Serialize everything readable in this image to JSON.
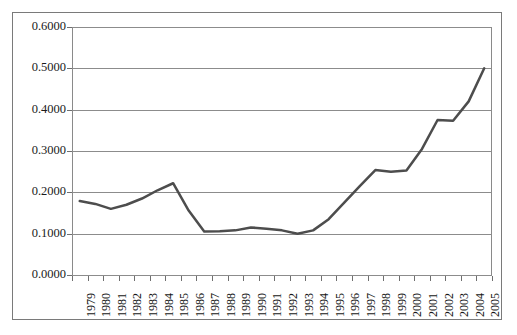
{
  "chart_data": {
    "type": "line",
    "title": "",
    "subtitle": "",
    "xlabel": "",
    "ylabel": "",
    "categories": [
      "1979",
      "1980",
      "1981",
      "1982",
      "1983",
      "1984",
      "1985",
      "1986",
      "1987",
      "1988",
      "1989",
      "1990",
      "1991",
      "1992",
      "1993",
      "1994",
      "1995",
      "1996",
      "1997",
      "1998",
      "1999",
      "2000",
      "2001",
      "2002",
      "2003",
      "2004",
      "2005"
    ],
    "values": [
      0.179,
      0.172,
      0.16,
      0.17,
      0.185,
      0.205,
      0.222,
      0.156,
      0.105,
      0.106,
      0.108,
      0.115,
      0.112,
      0.108,
      0.1,
      0.108,
      0.135,
      0.175,
      0.215,
      0.254,
      0.25,
      0.253,
      0.305,
      0.375,
      0.373,
      0.42,
      0.5
    ],
    "series": [
      {
        "name": "series-1",
        "values": [
          0.179,
          0.172,
          0.16,
          0.17,
          0.185,
          0.205,
          0.222,
          0.156,
          0.105,
          0.106,
          0.108,
          0.115,
          0.112,
          0.108,
          0.1,
          0.108,
          0.135,
          0.175,
          0.215,
          0.254,
          0.25,
          0.253,
          0.305,
          0.375,
          0.373,
          0.42,
          0.5
        ],
        "color": "#4d4d4d"
      }
    ],
    "ylim": [
      0.0,
      0.6
    ],
    "ytick_labels": [
      "0.0000",
      "0.1000",
      "0.2000",
      "0.3000",
      "0.4000",
      "0.5000",
      "0.6000"
    ],
    "ytick_values": [
      0.0,
      0.1,
      0.2,
      0.3,
      0.4,
      0.5,
      0.6
    ],
    "grid": true,
    "grid_axis": "y",
    "legend": false,
    "legend_position": "none",
    "line_width": 2.5,
    "markers": false,
    "colors": {
      "line": "#4d4d4d",
      "grid": "#8c8c8c",
      "axis": "#8a8a8a",
      "frame": "#7a7a7a",
      "text": "#1a1a1a",
      "background": "#ffffff"
    }
  }
}
